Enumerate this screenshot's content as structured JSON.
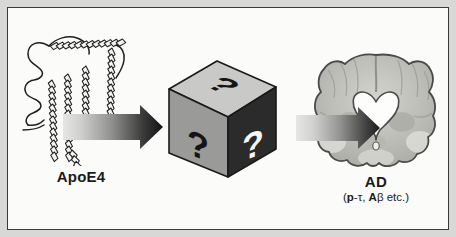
{
  "figure": {
    "domain": "scientific-diagram",
    "caption_flow": "ApoE4 leads through an unknown mechanism to Alzheimer's disease",
    "background_color": "#d8d8d6",
    "panel_color": "#fbfbfa",
    "border_color": "#3a3a3a"
  },
  "apoe4": {
    "label": "ApoE4",
    "structure_name": "apoe4-protein-ribbon",
    "description": "alpha-helical ribbon structure",
    "outline_color": "#1f1f1f",
    "fill_color": "#f2f2f0"
  },
  "blackbox": {
    "name": "unknown-mechanism-cube",
    "question_mark": "?",
    "faces": [
      {
        "name": "top",
        "symbol": "?",
        "face_color": "#c9c9c7",
        "symbol_color": "#151515"
      },
      {
        "name": "left",
        "symbol": "?",
        "face_color": "#9a9a98",
        "symbol_color": "#151515"
      },
      {
        "name": "right",
        "symbol": "?",
        "face_color": "#2b2b2b",
        "symbol_color": "#f6f6f4"
      }
    ],
    "edge_color": "#1a1a1a"
  },
  "brain": {
    "label": "AD",
    "sublabel_full": "(p-τ, Aβ etc.)",
    "sublabel_parts": [
      {
        "text": "(",
        "bold": false
      },
      {
        "text": "p",
        "bold": true
      },
      {
        "text": "-τ, ",
        "bold": false
      },
      {
        "text": "A",
        "bold": true
      },
      {
        "text": "β etc.)",
        "bold": false
      }
    ],
    "image_name": "coronal-brain-section",
    "description": "coronal brain section with enlarged ventricles",
    "tissue_color": "#b9b9b4",
    "ventricle_color": "#fdfdfb",
    "outline_color": "#4a4a48"
  },
  "arrows": [
    {
      "name": "arrow-apoe4-to-blackbox",
      "from": "ApoE4",
      "to": "unknown mechanism",
      "gradient_start": "#e6e6e4",
      "gradient_end": "#121212"
    },
    {
      "name": "arrow-blackbox-to-brain",
      "from": "unknown mechanism",
      "to": "AD",
      "gradient_start": "#e6e6e4",
      "gradient_end": "#1c1c1c"
    }
  ]
}
